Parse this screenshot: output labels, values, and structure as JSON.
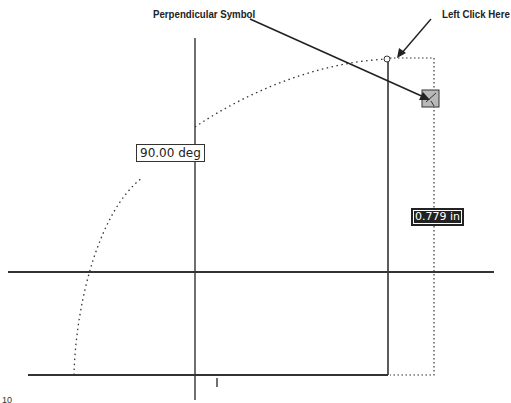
{
  "callouts": {
    "perpendicular_symbol": "Perpendicular Symbol",
    "left_click_here": "Left Click Here"
  },
  "dimensions": {
    "angle": "90.00 deg",
    "length": "0.779 in"
  },
  "icons": {
    "perpendicular_constraint": "perpendicular-symbol-icon",
    "endpoint_marker": "endpoint-circle-icon"
  },
  "colors": {
    "line": "#333333",
    "symbol_fill": "#b8b8b8",
    "length_box_bg": "#222222"
  },
  "page_fragment": "10"
}
